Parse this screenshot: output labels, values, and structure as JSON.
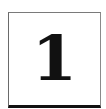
{
  "tile": {
    "value": "1",
    "border_color": "#7a7a7a",
    "bottom_border_color": "#111111",
    "text_color": "#111111",
    "background": "#ffffff"
  }
}
